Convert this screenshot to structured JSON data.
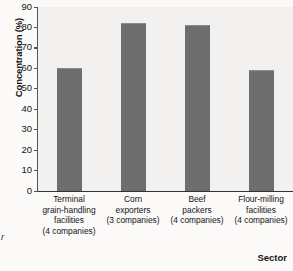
{
  "chart_data": {
    "type": "bar",
    "title": "",
    "xlabel": "Sector",
    "ylabel": "Concentration (%)",
    "ylim": [
      0,
      90
    ],
    "yticks": [
      0,
      10,
      20,
      30,
      40,
      50,
      60,
      70,
      80,
      90
    ],
    "grid": false,
    "legend": null,
    "categories": [
      "Terminal grain-handling facilities (4 companies)",
      "Corn exporters (3 companies)",
      "Beef packers (4 companies)",
      "Flour-milling facilities (4 companies)"
    ],
    "category_lines": [
      [
        "Terminal",
        "grain-handling",
        "facilities",
        "(4 companies)"
      ],
      [
        "Corn",
        "exporters",
        "(3 companies)"
      ],
      [
        "Beef",
        "packers",
        "(4 companies)"
      ],
      [
        "Flour-milling",
        "facilities",
        "(4 companies)"
      ]
    ],
    "values": [
      60,
      82,
      81,
      59
    ],
    "bar_color": "#6e6e6e",
    "plot_background": "#f2f1ef",
    "page_background": "#fbfaf8",
    "axis_color": "#333333"
  },
  "margin_note": "r"
}
